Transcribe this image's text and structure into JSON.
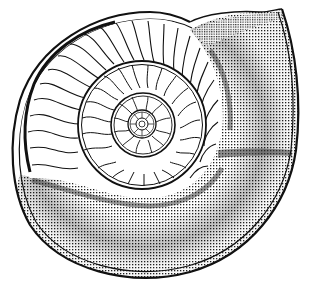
{
  "image": {
    "subject": "Ammonite shell cross-section line drawing",
    "style": "black ink engraving on white",
    "colors": {
      "ink": "#111111",
      "background": "#ffffff"
    },
    "features": {
      "septa_outer_whorl": 22,
      "septa_middle_whorl": 18,
      "septa_inner_whorl": 12,
      "whorls_visible": 4
    }
  }
}
